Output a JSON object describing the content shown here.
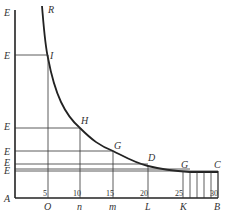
{
  "diagram": {
    "type": "geometric hyperbola-like curve with ordinates",
    "point_labels": {
      "R": "R",
      "I": "I",
      "H": "H",
      "G1": "G",
      "D": "D",
      "G2": "G",
      "C": "C",
      "A": "A",
      "O": "O",
      "n": "n",
      "m": "m",
      "L": "L",
      "K": "K",
      "B": "B"
    },
    "left_axis_labels": [
      "E",
      "E",
      "E",
      "E",
      "E",
      "E"
    ],
    "tick_numbers": [
      "5",
      "10",
      "15",
      "20",
      "25",
      "30"
    ],
    "colors": {
      "line": "#222222",
      "text": "#333333",
      "background": "#ffffff"
    }
  }
}
